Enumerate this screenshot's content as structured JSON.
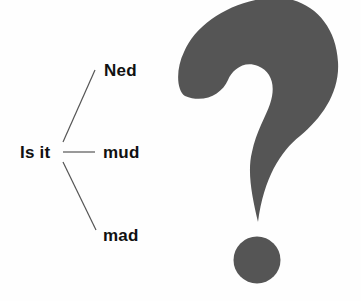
{
  "diagram": {
    "root": {
      "label": "Is it"
    },
    "branches": [
      {
        "label": "Ned"
      },
      {
        "label": "mud"
      },
      {
        "label": "mad"
      }
    ]
  },
  "symbol": {
    "icon": "question-mark-icon",
    "color": "#555555"
  },
  "colors": {
    "text": "#111111",
    "line": "#555555",
    "background": "#fefefe"
  }
}
